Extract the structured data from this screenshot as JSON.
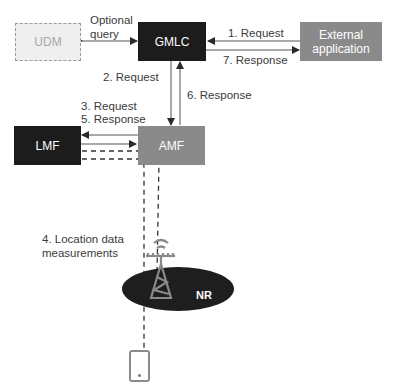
{
  "diagram": {
    "nodes": {
      "udm": {
        "label": "UDM",
        "style": "dashed-optional"
      },
      "gmlc": {
        "label": "GMLC"
      },
      "external_app": {
        "label_line1": "External",
        "label_line2": "application"
      },
      "lmf": {
        "label": "LMF"
      },
      "amf": {
        "label": "AMF"
      },
      "nr": {
        "label": "NR"
      },
      "ue": {
        "label": ""
      }
    },
    "edges": {
      "udm_gmlc": {
        "label_line1": "Optional",
        "label_line2": "query"
      },
      "ext_to_gmlc": {
        "label": "1. Request"
      },
      "gmlc_to_ext": {
        "label": "7. Response"
      },
      "gmlc_to_amf": {
        "label": "2. Request"
      },
      "amf_to_gmlc": {
        "label": "6. Response"
      },
      "amf_lmf_req": {
        "label": "3. Request"
      },
      "amf_lmf_resp": {
        "label": "5. Response"
      },
      "location": {
        "label_line1": "4. Location data",
        "label_line2": "measurements"
      }
    },
    "colors": {
      "gmlc": "#1c1c1c",
      "lmf": "#1c1c1c",
      "amf": "#8a8a8a",
      "external": "#8a8a8a",
      "udm_fill": "#efefef",
      "udm_border": "#9a9a9a",
      "nr_ellipse": "#1e1e1e",
      "tower": "#8a8a8a"
    }
  }
}
